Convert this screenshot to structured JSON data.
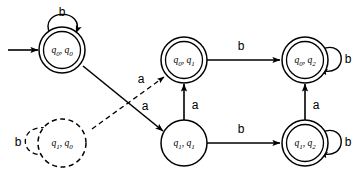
{
  "figure": {
    "type": "finite-automaton-state-diagram",
    "alphabet": [
      "a",
      "b"
    ],
    "start_state": "q0,q0"
  },
  "states": [
    {
      "id": "q0q0",
      "label_main": "q",
      "label_sub1": "0",
      "label_sep": ", ",
      "label_main2": "q",
      "label_sub2": "0",
      "accepting": true,
      "is_start": true,
      "style": "solid",
      "x": 62,
      "y": 50
    },
    {
      "id": "q1q0",
      "label_main": "q",
      "label_sub1": "1",
      "label_sep": ", ",
      "label_main2": "q",
      "label_sub2": "0",
      "accepting": false,
      "is_start": false,
      "style": "dashed",
      "x": 62,
      "y": 143
    },
    {
      "id": "q0q1",
      "label_main": "q",
      "label_sub1": "0",
      "label_sep": ", ",
      "label_main2": "q",
      "label_sub2": "1",
      "accepting": true,
      "is_start": false,
      "style": "solid",
      "x": 184,
      "y": 60
    },
    {
      "id": "q1q1",
      "label_main": "q",
      "label_sub1": "1",
      "label_sep": ", ",
      "label_main2": "q",
      "label_sub2": "1",
      "accepting": false,
      "is_start": false,
      "style": "solid",
      "x": 184,
      "y": 143
    },
    {
      "id": "q0q2",
      "label_main": "q",
      "label_sub1": "0",
      "label_sep": ", ",
      "label_main2": "q",
      "label_sub2": "2",
      "accepting": true,
      "is_start": false,
      "style": "solid",
      "x": 305,
      "y": 60
    },
    {
      "id": "q1q2",
      "label_main": "q",
      "label_sub1": "1",
      "label_sep": ", ",
      "label_main2": "q",
      "label_sub2": "2",
      "accepting": true,
      "is_start": false,
      "style": "solid",
      "x": 305,
      "y": 143
    }
  ],
  "transitions": [
    {
      "id": "t-q0q0-self",
      "from": "q0q0",
      "to": "q0q0",
      "symbol": "b",
      "style": "solid",
      "kind": "self-loop-top"
    },
    {
      "id": "t-q0q0-q1q1",
      "from": "q0q0",
      "to": "q1q1",
      "symbol": "a",
      "style": "solid",
      "kind": "diagonal"
    },
    {
      "id": "t-q1q0-self",
      "from": "q1q0",
      "to": "q1q0",
      "symbol": "b",
      "style": "dashed",
      "kind": "self-loop-left"
    },
    {
      "id": "t-q1q0-q0q1",
      "from": "q1q0",
      "to": "q0q1",
      "symbol": "a",
      "style": "dashed",
      "kind": "diagonal"
    },
    {
      "id": "t-q0q1-q0q2",
      "from": "q0q1",
      "to": "q0q2",
      "symbol": "b",
      "style": "solid",
      "kind": "horizontal"
    },
    {
      "id": "t-q0q1-q1q1",
      "from": "q0q1",
      "to": "q1q1",
      "symbol": "a",
      "style": "solid",
      "kind": "vertical-bidirectional"
    },
    {
      "id": "t-q1q1-q1q2",
      "from": "q1q1",
      "to": "q1q2",
      "symbol": "b",
      "style": "solid",
      "kind": "horizontal"
    },
    {
      "id": "t-q0q2-self",
      "from": "q0q2",
      "to": "q0q2",
      "symbol": "b",
      "style": "solid",
      "kind": "self-loop-right"
    },
    {
      "id": "t-q0q2-q1q2",
      "from": "q0q2",
      "to": "q1q2",
      "symbol": "a",
      "style": "solid",
      "kind": "vertical-bidirectional"
    },
    {
      "id": "t-q1q2-self",
      "from": "q1q2",
      "to": "q1q2",
      "symbol": "b",
      "style": "solid",
      "kind": "self-loop-right"
    }
  ],
  "labels": {
    "loop_q0q0_b": "b",
    "loop_q1q0_b": "b",
    "loop_q0q2_b": "b",
    "loop_q1q2_b": "b",
    "edge_q0q1_q0q2_b": "b",
    "edge_q1q1_q1q2_b": "b",
    "edge_vert_mid_a": "a",
    "edge_vert_right_a": "a",
    "edge_diag_solid_a": "a",
    "edge_diag_dashed_a": "a"
  }
}
